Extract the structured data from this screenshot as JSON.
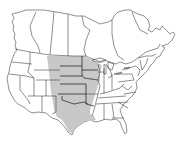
{
  "map": {
    "type": "range-map",
    "region": "North America (Canada and contiguous United States)",
    "colors": {
      "background": "#ffffff",
      "land": "#ffffff",
      "border": "#333333",
      "range_fill": "#c8c8c8"
    },
    "highlighted_range": {
      "description": "Great Plains and central Mississippi valley",
      "states": [
        "North Dakota",
        "South Dakota",
        "Nebraska",
        "Kansas",
        "Oklahoma",
        "Texas",
        "Minnesota",
        "Iowa",
        "Missouri",
        "Arkansas",
        "Louisiana",
        "Wisconsin",
        "Illinois",
        "eastern Montana",
        "eastern Wyoming",
        "eastern Colorado",
        "eastern New Mexico"
      ]
    }
  }
}
